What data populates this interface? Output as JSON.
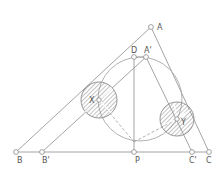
{
  "diagram": {
    "colors": {
      "line": "#9a9a9a",
      "hatch": "#8a8a8a",
      "point": "#8a8a8a",
      "label": "#555555"
    },
    "points": [
      {
        "id": "A",
        "label": "A",
        "x": 151,
        "y": 27,
        "lx": 157,
        "ly": 29
      },
      {
        "id": "D",
        "label": "D",
        "x": 134,
        "y": 57,
        "lx": 131,
        "ly": 52
      },
      {
        "id": "A2",
        "label": "A'",
        "x": 146,
        "y": 57,
        "lx": 144,
        "ly": 52
      },
      {
        "id": "B",
        "label": "B",
        "x": 16,
        "y": 152,
        "lx": 17,
        "ly": 163
      },
      {
        "id": "B2",
        "label": "B'",
        "x": 42,
        "y": 152,
        "lx": 42,
        "ly": 163
      },
      {
        "id": "P",
        "label": "P",
        "x": 134,
        "y": 152,
        "lx": 135,
        "ly": 163
      },
      {
        "id": "C2",
        "label": "C'",
        "x": 192,
        "y": 152,
        "lx": 189,
        "ly": 163
      },
      {
        "id": "C",
        "label": "C",
        "x": 209,
        "y": 152,
        "lx": 206,
        "ly": 163
      },
      {
        "id": "X",
        "label": "X",
        "x": 99,
        "y": 100,
        "lx": 89,
        "ly": 103
      },
      {
        "id": "Y",
        "label": "Y",
        "x": 177,
        "y": 119,
        "lx": 181,
        "ly": 125
      }
    ],
    "circles": [
      {
        "id": "circumcircle",
        "cx": 140,
        "cy": 99,
        "r": 42,
        "hatched": false
      },
      {
        "id": "circle-X",
        "cx": 99,
        "cy": 100,
        "r": 18,
        "hatched": true
      },
      {
        "id": "circle-Y",
        "cx": 177,
        "cy": 119,
        "r": 17,
        "hatched": true
      }
    ]
  }
}
